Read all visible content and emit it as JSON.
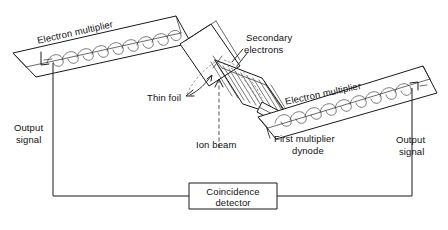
{
  "figure": {
    "type": "schematic-diagram",
    "background_color": "#ffffff",
    "line_color": "#1a1a1a"
  },
  "labels": {
    "electron_multiplier_left": "Electron multiplier",
    "electron_multiplier_right": "Electron multiplier",
    "secondary_electrons_line1": "Secondary",
    "secondary_electrons_line2": "electrons",
    "thin_foil": "Thin foil",
    "ion_beam": "Ion beam",
    "first_multiplier_dynode_line1": "First multiplier",
    "first_multiplier_dynode_line2": "dynode",
    "output_signal_left_line1": "Output",
    "output_signal_left_line2": "signal",
    "output_signal_right_line1": "Output",
    "output_signal_right_line2": "signal",
    "coincidence_detector_line1": "Coincidence",
    "coincidence_detector_line2": "detector"
  },
  "components": [
    {
      "name": "electron-multiplier-left",
      "label": "Electron multiplier",
      "description": "tilted rectangular housing containing a chain of scalloped dynodes, upper-left of figure"
    },
    {
      "name": "electron-multiplier-right",
      "label": "Electron multiplier",
      "description": "tilted rectangular housing containing a chain of scalloped dynodes, right of figure"
    },
    {
      "name": "thin-foil",
      "label": "Thin foil",
      "description": "tilted rectangular foil plate intersected by the ion beam"
    },
    {
      "name": "grid-assembly",
      "label": "Secondary electrons",
      "description": "tilted accelerating grid / mesh emitting secondary electrons toward the multipliers"
    },
    {
      "name": "first-multiplier-dynode",
      "label": "First multiplier dynode",
      "description": "first dynode at the entrance of the right electron multiplier"
    },
    {
      "name": "coincidence-detector",
      "label": "Coincidence detector",
      "description": "rectangular box at bottom centre wired to both multiplier output signals"
    }
  ],
  "signals": [
    {
      "name": "output-signal-left",
      "label": "Output signal"
    },
    {
      "name": "output-signal-right",
      "label": "Output signal"
    },
    {
      "name": "ion-beam",
      "label": "Ion beam",
      "direction": "upward into foil"
    }
  ],
  "counts": {
    "dynodes_left_multiplier": 9,
    "dynodes_right_multiplier": 9,
    "grid_mesh_lines": 11
  }
}
